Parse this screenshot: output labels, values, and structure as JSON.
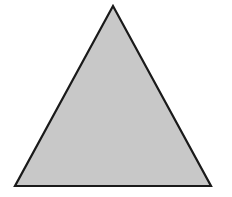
{
  "figure": {
    "shape": "triangle",
    "kind": "isosceles",
    "vertices": {
      "apex": [
        113,
        6
      ],
      "bottom_left": [
        15,
        186
      ],
      "bottom_right": [
        211,
        186
      ]
    },
    "fill_color": "#c8c8c8",
    "stroke_color": "#1a1a1a",
    "stroke_width": 2.2
  },
  "background_color": "#ffffff"
}
